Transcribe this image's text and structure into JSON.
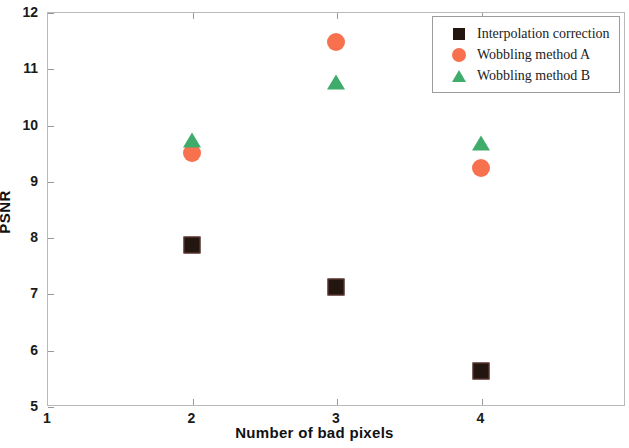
{
  "chart_data": {
    "type": "scatter",
    "title": "",
    "xlabel": "Number of bad pixels",
    "ylabel": "PSNR",
    "xlim": [
      1,
      5
    ],
    "ylim": [
      5,
      12
    ],
    "xticks": [
      "1",
      "2",
      "3",
      "4"
    ],
    "xtick_values": [
      1,
      2,
      3,
      4
    ],
    "yticks": [
      "5",
      "6",
      "7",
      "8",
      "9",
      "10",
      "11",
      "12"
    ],
    "ytick_values": [
      5,
      6,
      7,
      8,
      9,
      10,
      11,
      12
    ],
    "grid": false,
    "legend_position": "top-right",
    "x": [
      2,
      3,
      4
    ],
    "series": [
      {
        "name": "Interpolation correction",
        "marker": "square",
        "color": "#231510",
        "values": [
          7.86,
          7.12,
          5.63
        ]
      },
      {
        "name": "Wobbling method A",
        "marker": "circle",
        "color": "#f8714e",
        "values": [
          9.49,
          11.47,
          9.22
        ]
      },
      {
        "name": "Wobbling method B",
        "marker": "triangle",
        "color": "#3fac6b",
        "values": [
          9.73,
          10.76,
          9.68
        ]
      }
    ]
  }
}
